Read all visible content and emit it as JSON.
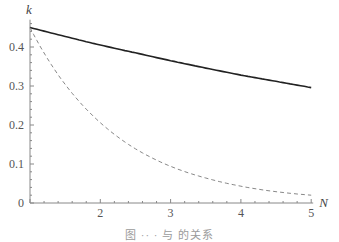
{
  "chart_data": {
    "type": "line",
    "title": "",
    "xlabel": "N",
    "ylabel": "k",
    "xlim": [
      1,
      5
    ],
    "ylim": [
      0,
      0.47
    ],
    "x_ticks": [
      2,
      3,
      4,
      5
    ],
    "y_ticks": [
      0,
      0.1,
      0.2,
      0.3,
      0.4
    ],
    "y_tick_labels": [
      "0",
      "0.1",
      "0.2",
      "0.3",
      "0.4"
    ],
    "x_tick_labels": [
      "2",
      "3",
      "4",
      "5"
    ],
    "grid": false,
    "legend": null,
    "x": [
      1,
      1.5,
      2,
      2.5,
      3,
      3.5,
      4,
      4.5,
      5
    ],
    "series": [
      {
        "name": "solid",
        "style": "solid",
        "color": "#222222",
        "values": [
          0.45,
          0.427,
          0.405,
          0.385,
          0.365,
          0.346,
          0.328,
          0.312,
          0.296
        ]
      },
      {
        "name": "dashed",
        "style": "dashed",
        "color": "#888888",
        "values": [
          0.45,
          0.304,
          0.206,
          0.139,
          0.094,
          0.064,
          0.043,
          0.029,
          0.02
        ]
      }
    ]
  },
  "caption": "图 ·· · 与 的关系"
}
